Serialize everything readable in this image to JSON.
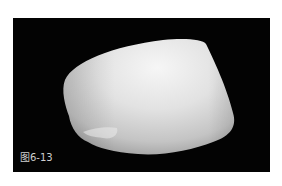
{
  "figure": {
    "caption": "图6-13",
    "colors": {
      "background": "#030303",
      "grain_highlight": "#f4f4f4",
      "grain_mid": "#d6d6d6",
      "grain_shadow": "#a9a9a9",
      "caption_text": "#cfcfcf"
    }
  }
}
